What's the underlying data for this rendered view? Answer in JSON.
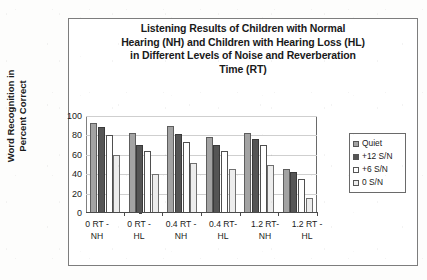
{
  "figure": {
    "title_lines": [
      "Listening Results of Children with Normal",
      "Hearing (NH) and Children with Hearing Loss (HL)",
      "in Different Levels of Noise and Reverberation",
      "Time (RT)"
    ]
  },
  "chart_data": {
    "type": "bar",
    "title": "Listening Results of Children with Normal Hearing (NH) and Children with Hearing Loss (HL) in Different Levels of Noise and Reverberation Time (RT)",
    "xlabel": "",
    "ylabel": "Word Recognition in Percent Correct",
    "ylim": [
      0,
      100
    ],
    "yticks": [
      0,
      20,
      40,
      60,
      80,
      100
    ],
    "grid": true,
    "legend_position": "right",
    "categories": [
      "0 RT - NH",
      "0 RT - HL",
      "0.4 RT - NH",
      "0.4 RT- HL",
      "1.2 RT- NH",
      "1.2 RT - HL"
    ],
    "series": [
      {
        "name": "Quiet",
        "color": "#a3a3a3",
        "values": [
          93,
          82,
          90,
          78,
          82,
          45
        ]
      },
      {
        "name": "+12 S/N",
        "color": "#555555",
        "values": [
          89,
          70,
          81,
          70,
          76,
          42
        ]
      },
      {
        "name": "+6 S/N",
        "color": "#ffffff",
        "values": [
          80,
          64,
          73,
          64,
          70,
          35
        ]
      },
      {
        "name": "0 S/N",
        "color": "#ededed",
        "values": [
          60,
          40,
          52,
          45,
          50,
          15
        ]
      }
    ]
  },
  "y_axis": {
    "title_lines": [
      "Word Recognition in",
      "Percent Correct"
    ],
    "ticks": [
      "100",
      "80",
      "60",
      "40",
      "20",
      "0"
    ]
  },
  "x_axis": {
    "labels": [
      {
        "line1": "0 RT -",
        "line2": "NH"
      },
      {
        "line1": "0 RT -",
        "line2": "HL"
      },
      {
        "line1": "0.4 RT -",
        "line2": "NH"
      },
      {
        "line1": "0.4 RT-",
        "line2": "HL"
      },
      {
        "line1": "1.2 RT-",
        "line2": "NH"
      },
      {
        "line1": "1.2 RT -",
        "line2": "HL"
      }
    ]
  },
  "legend": {
    "items": [
      {
        "label": "Quiet",
        "color": "#a3a3a3"
      },
      {
        "label": "+12 S/N",
        "color": "#555555"
      },
      {
        "label": "+6 S/N",
        "color": "#ffffff"
      },
      {
        "label": "0 S/N",
        "color": "#ededed"
      }
    ]
  }
}
